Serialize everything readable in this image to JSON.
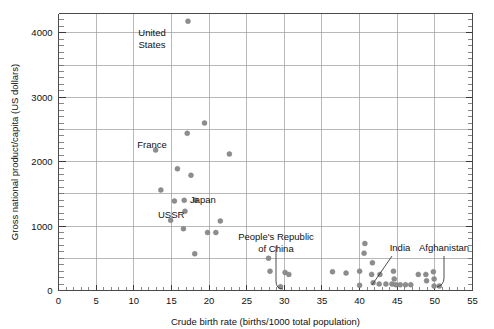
{
  "chart_data": {
    "type": "scatter",
    "title": "",
    "xlabel": "Crude birth rate (births/1000 total population)",
    "ylabel": "Gross national product/capita (US dollars)",
    "xlim": [
      0,
      55
    ],
    "ylim": [
      0,
      4300
    ],
    "x_ticks": [
      0,
      5,
      10,
      15,
      20,
      25,
      30,
      35,
      40,
      45,
      50,
      55
    ],
    "x_tick_labels": [
      "0",
      "5",
      "10",
      "15",
      "20",
      "25",
      "30",
      "35",
      "40",
      "45",
      "50",
      "55"
    ],
    "x_major_step": 5,
    "x_minor_step": 1,
    "y_ticks": [
      0,
      1000,
      2000,
      3000,
      4000
    ],
    "y_tick_labels": [
      "0",
      "1000",
      "2000",
      "3000",
      "4000"
    ],
    "y_major_step": 1000,
    "y_minor_step": 100,
    "y_gridline_step": 500,
    "grid": true,
    "legend": "none",
    "marker_color": "#8d8d8d",
    "axis_color": "#4a4a4a",
    "grid_color": "#9a9a9a",
    "points": [
      {
        "x": 17.2,
        "y": 4180
      },
      {
        "x": 19.4,
        "y": 2600
      },
      {
        "x": 17.1,
        "y": 2440
      },
      {
        "x": 12.9,
        "y": 2180
      },
      {
        "x": 22.7,
        "y": 2120
      },
      {
        "x": 15.8,
        "y": 1890
      },
      {
        "x": 17.6,
        "y": 1790
      },
      {
        "x": 13.6,
        "y": 1560
      },
      {
        "x": 15.4,
        "y": 1390
      },
      {
        "x": 16.7,
        "y": 1400
      },
      {
        "x": 18.2,
        "y": 1400
      },
      {
        "x": 16.8,
        "y": 1230
      },
      {
        "x": 14.9,
        "y": 1090
      },
      {
        "x": 21.5,
        "y": 1080
      },
      {
        "x": 16.6,
        "y": 960
      },
      {
        "x": 19.8,
        "y": 900
      },
      {
        "x": 20.9,
        "y": 900
      },
      {
        "x": 18.1,
        "y": 570
      },
      {
        "x": 27.9,
        "y": 500
      },
      {
        "x": 28.1,
        "y": 300
      },
      {
        "x": 30.1,
        "y": 280
      },
      {
        "x": 30.6,
        "y": 250
      },
      {
        "x": 29.5,
        "y": 60
      },
      {
        "x": 36.4,
        "y": 290
      },
      {
        "x": 38.2,
        "y": 270
      },
      {
        "x": 40.0,
        "y": 300
      },
      {
        "x": 40.0,
        "y": 80
      },
      {
        "x": 40.7,
        "y": 730
      },
      {
        "x": 40.6,
        "y": 580
      },
      {
        "x": 41.7,
        "y": 430
      },
      {
        "x": 41.6,
        "y": 250
      },
      {
        "x": 41.8,
        "y": 120
      },
      {
        "x": 42.7,
        "y": 250
      },
      {
        "x": 42.6,
        "y": 100
      },
      {
        "x": 43.5,
        "y": 100
      },
      {
        "x": 44.3,
        "y": 100
      },
      {
        "x": 44.5,
        "y": 300
      },
      {
        "x": 44.6,
        "y": 180
      },
      {
        "x": 44.8,
        "y": 90
      },
      {
        "x": 45.4,
        "y": 90
      },
      {
        "x": 46.1,
        "y": 90
      },
      {
        "x": 46.8,
        "y": 90
      },
      {
        "x": 47.8,
        "y": 250
      },
      {
        "x": 48.8,
        "y": 250
      },
      {
        "x": 48.9,
        "y": 150
      },
      {
        "x": 49.8,
        "y": 290
      },
      {
        "x": 49.9,
        "y": 180
      },
      {
        "x": 49.9,
        "y": 70
      },
      {
        "x": 50.6,
        "y": 70
      }
    ],
    "annotations": [
      {
        "label": "United States",
        "lines": [
          "United",
          "States"
        ],
        "target": {
          "x": 17.2,
          "y": 4180
        },
        "leader": false
      },
      {
        "label": "France",
        "lines": [
          "France"
        ],
        "target": {
          "x": 17.1,
          "y": 2440
        },
        "leader": false
      },
      {
        "label": "Japan",
        "lines": [
          "Japan"
        ],
        "target": {
          "x": 18.2,
          "y": 1400
        },
        "leader": false
      },
      {
        "label": "USSR",
        "lines": [
          "USSR"
        ],
        "target": {
          "x": 16.8,
          "y": 1230
        },
        "leader": false
      },
      {
        "label": "People's Republic of China",
        "lines": [
          "People's Republic",
          "of China"
        ],
        "target": {
          "x": 29.5,
          "y": 60
        },
        "leader": true
      },
      {
        "label": "India",
        "lines": [
          "India"
        ],
        "target": {
          "x": 41.8,
          "y": 120
        },
        "leader": true
      },
      {
        "label": "Afghanistan",
        "lines": [
          "Afghanistan"
        ],
        "target": {
          "x": 50.6,
          "y": 70
        },
        "leader": true
      }
    ]
  }
}
